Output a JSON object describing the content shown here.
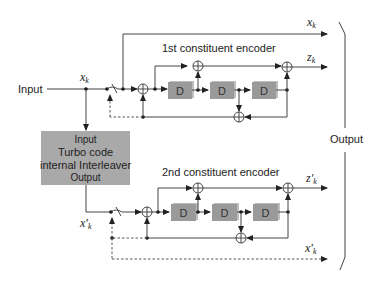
{
  "diagram": {
    "type": "turbo-encoder-block-diagram",
    "input_label": "Input",
    "output_label": "Output",
    "signals": {
      "xk": {
        "main": "x",
        "sub": "k"
      },
      "zk": {
        "main": "z",
        "sub": "k"
      },
      "zpk": {
        "main": "z'",
        "sub": "k"
      },
      "xpk": {
        "main": "x'",
        "sub": "k"
      },
      "xk_input": {
        "main": "x",
        "sub": "k"
      },
      "xpk_input": {
        "main": "x'",
        "sub": "k"
      }
    },
    "interleaver": {
      "line1": "Input",
      "line2": "Turbo code",
      "line3": "internal Interleaver",
      "line4": "Output"
    },
    "encoder1": {
      "title": "1st constituent encoder",
      "delays": [
        "D",
        "D",
        "D"
      ]
    },
    "encoder2": {
      "title": "2nd constituent encoder",
      "delays": [
        "D",
        "D",
        "D"
      ]
    },
    "colors": {
      "line": "#444444",
      "delay_box": "#9a9a9a",
      "interleaver_box": "#a9a9a9",
      "background": "#ffffff"
    }
  }
}
